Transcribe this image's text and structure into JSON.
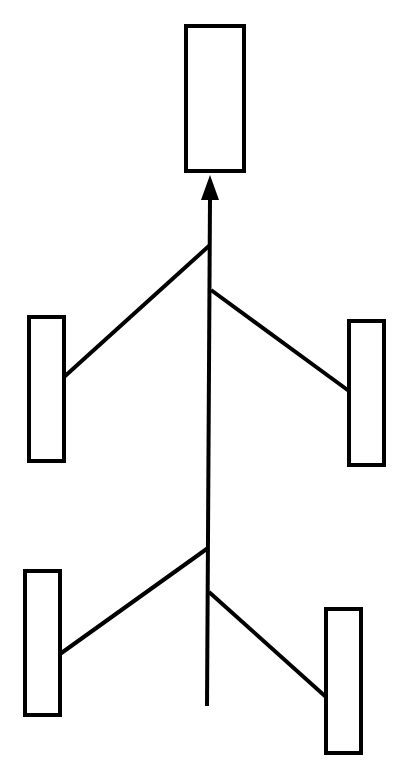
{
  "diagram": {
    "stroke_color": "#000000",
    "background": "#ffffff",
    "stroke_width": 4,
    "nodes": [
      {
        "id": "top-box",
        "x": 186,
        "y": 26,
        "w": 58,
        "h": 145
      },
      {
        "id": "left-box-1",
        "x": 29,
        "y": 317,
        "w": 35,
        "h": 144
      },
      {
        "id": "right-box-1",
        "x": 349,
        "y": 321,
        "w": 35,
        "h": 144
      },
      {
        "id": "left-box-2",
        "x": 25,
        "y": 571,
        "w": 35,
        "h": 144
      },
      {
        "id": "right-box-2",
        "x": 326,
        "y": 609,
        "w": 35,
        "h": 144
      }
    ],
    "spine": {
      "x1": 210,
      "y1": 198,
      "x2": 207,
      "y2": 706
    },
    "arrowhead": {
      "tip": [
        210,
        175
      ],
      "base_left": [
        201,
        200
      ],
      "base_right": [
        219,
        200
      ]
    },
    "branches": [
      {
        "from": "spine",
        "to": "left-box-1",
        "x1": 210,
        "y1": 245,
        "x2": 64,
        "y2": 377
      },
      {
        "from": "spine",
        "to": "right-box-1",
        "x1": 211,
        "y1": 290,
        "x2": 349,
        "y2": 391
      },
      {
        "from": "spine",
        "to": "left-box-2",
        "x1": 208,
        "y1": 548,
        "x2": 60,
        "y2": 654
      },
      {
        "from": "spine",
        "to": "right-box-2",
        "x1": 209,
        "y1": 592,
        "x2": 326,
        "y2": 697
      }
    ]
  }
}
